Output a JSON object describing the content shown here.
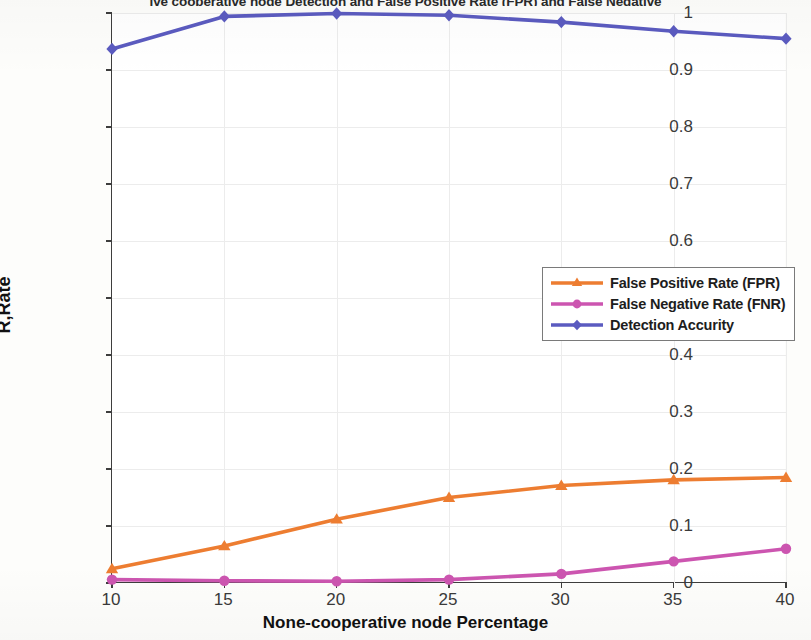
{
  "chart_data": {
    "type": "line",
    "title": "ive cooperative node Detection and False Positive Rate (FPR) and False Negative",
    "xlabel": "None-cooperative node Percentage",
    "ylabel": "R,Rate",
    "x": [
      10,
      15,
      20,
      25,
      30,
      35,
      40
    ],
    "xtick_labels": [
      "10",
      "15",
      "20",
      "25",
      "30",
      "35",
      "40"
    ],
    "ytick_labels": [
      "0",
      "0.1",
      "0.2",
      "0.3",
      "0.4",
      "0.5",
      "0.6",
      "0.7",
      "0.8",
      "0.9",
      "1"
    ],
    "ytick_values": [
      0,
      0.1,
      0.2,
      0.3,
      0.4,
      0.5,
      0.6,
      0.7,
      0.8,
      0.9,
      1
    ],
    "xlim": [
      10,
      40
    ],
    "ylim": [
      0,
      1
    ],
    "grid": true,
    "legend_position": "center-right",
    "series": [
      {
        "name": "False Positive Rate (FPR)",
        "color": "#ED7D31",
        "marker": "triangle",
        "values": [
          0.025,
          0.065,
          0.112,
          0.15,
          0.171,
          0.181,
          0.185
        ]
      },
      {
        "name": "False Negative Rate (FNR)",
        "color": "#CC55B0",
        "marker": "circle",
        "values": [
          0.006,
          0.004,
          0.003,
          0.006,
          0.016,
          0.038,
          0.06
        ]
      },
      {
        "name": "Detection Accurity",
        "color": "#5B5BC0",
        "marker": "diamond",
        "values": [
          0.937,
          0.994,
          0.999,
          0.996,
          0.984,
          0.968,
          0.955
        ]
      }
    ]
  },
  "legend": {
    "items": [
      {
        "label": "False Positive Rate (FPR)"
      },
      {
        "label": "False Negative Rate (FNR)"
      },
      {
        "label": "Detection Accurity"
      }
    ]
  }
}
